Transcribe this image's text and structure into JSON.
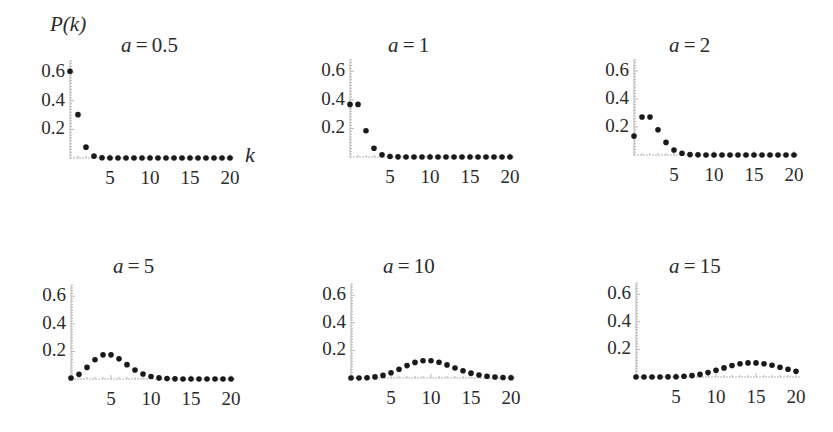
{
  "figure": {
    "y_axis_label": "P(k)",
    "x_axis_label": "k",
    "formula_hint": "Poisson: P(k) = a^k e^-a / k!"
  },
  "chart_data": [
    {
      "type": "scatter",
      "title": "a = 0.5",
      "param_a": 0.5,
      "xlabel": "k",
      "ylabel": "P(k)",
      "x_ticks": [
        5,
        10,
        15,
        20
      ],
      "y_ticks": [
        0.2,
        0.4,
        0.6
      ],
      "xlim": [
        0,
        20
      ],
      "ylim": [
        0,
        0.68
      ],
      "x": [
        0,
        1,
        2,
        3,
        4,
        5,
        6,
        7,
        8,
        9,
        10,
        11,
        12,
        13,
        14,
        15,
        16,
        17,
        18,
        19,
        20
      ],
      "values": [
        0.607,
        0.303,
        0.076,
        0.013,
        0.002,
        0.0,
        0.0,
        0.0,
        0.0,
        0.0,
        0.0,
        0.0,
        0.0,
        0.0,
        0.0,
        0.0,
        0.0,
        0.0,
        0.0,
        0.0,
        0.0
      ]
    },
    {
      "type": "scatter",
      "title": "a = 1",
      "param_a": 1,
      "xlabel": "k",
      "ylabel": "P(k)",
      "x_ticks": [
        5,
        10,
        15,
        20
      ],
      "y_ticks": [
        0.2,
        0.4,
        0.6
      ],
      "xlim": [
        0,
        20
      ],
      "ylim": [
        0,
        0.68
      ],
      "x": [
        0,
        1,
        2,
        3,
        4,
        5,
        6,
        7,
        8,
        9,
        10,
        11,
        12,
        13,
        14,
        15,
        16,
        17,
        18,
        19,
        20
      ],
      "values": [
        0.368,
        0.368,
        0.184,
        0.061,
        0.015,
        0.003,
        0.001,
        0.0,
        0.0,
        0.0,
        0.0,
        0.0,
        0.0,
        0.0,
        0.0,
        0.0,
        0.0,
        0.0,
        0.0,
        0.0,
        0.0
      ]
    },
    {
      "type": "scatter",
      "title": "a = 2",
      "param_a": 2,
      "xlabel": "k",
      "ylabel": "P(k)",
      "x_ticks": [
        5,
        10,
        15,
        20
      ],
      "y_ticks": [
        0.2,
        0.4,
        0.6
      ],
      "xlim": [
        0,
        20
      ],
      "ylim": [
        0,
        0.68
      ],
      "x": [
        0,
        1,
        2,
        3,
        4,
        5,
        6,
        7,
        8,
        9,
        10,
        11,
        12,
        13,
        14,
        15,
        16,
        17,
        18,
        19,
        20
      ],
      "values": [
        0.135,
        0.271,
        0.271,
        0.18,
        0.09,
        0.036,
        0.012,
        0.003,
        0.001,
        0.0,
        0.0,
        0.0,
        0.0,
        0.0,
        0.0,
        0.0,
        0.0,
        0.0,
        0.0,
        0.0,
        0.0
      ]
    },
    {
      "type": "scatter",
      "title": "a = 5",
      "param_a": 5,
      "xlabel": "k",
      "ylabel": "P(k)",
      "x_ticks": [
        5,
        10,
        15,
        20
      ],
      "y_ticks": [
        0.2,
        0.4,
        0.6
      ],
      "xlim": [
        0,
        20
      ],
      "ylim": [
        0,
        0.68
      ],
      "x": [
        0,
        1,
        2,
        3,
        4,
        5,
        6,
        7,
        8,
        9,
        10,
        11,
        12,
        13,
        14,
        15,
        16,
        17,
        18,
        19,
        20
      ],
      "values": [
        0.007,
        0.034,
        0.084,
        0.14,
        0.175,
        0.175,
        0.146,
        0.104,
        0.065,
        0.036,
        0.018,
        0.008,
        0.003,
        0.001,
        0.0,
        0.0,
        0.0,
        0.0,
        0.0,
        0.0,
        0.0
      ]
    },
    {
      "type": "scatter",
      "title": "a = 10",
      "param_a": 10,
      "xlabel": "k",
      "ylabel": "P(k)",
      "x_ticks": [
        5,
        10,
        15,
        20
      ],
      "y_ticks": [
        0.2,
        0.4,
        0.6
      ],
      "xlim": [
        0,
        20
      ],
      "ylim": [
        0,
        0.68
      ],
      "x": [
        0,
        1,
        2,
        3,
        4,
        5,
        6,
        7,
        8,
        9,
        10,
        11,
        12,
        13,
        14,
        15,
        16,
        17,
        18,
        19,
        20
      ],
      "values": [
        0.0,
        0.0,
        0.002,
        0.008,
        0.019,
        0.038,
        0.063,
        0.09,
        0.113,
        0.125,
        0.125,
        0.114,
        0.095,
        0.073,
        0.052,
        0.035,
        0.022,
        0.013,
        0.007,
        0.004,
        0.002
      ]
    },
    {
      "type": "scatter",
      "title": "a = 15",
      "param_a": 15,
      "xlabel": "k",
      "ylabel": "P(k)",
      "x_ticks": [
        5,
        10,
        15,
        20
      ],
      "y_ticks": [
        0.2,
        0.4,
        0.6
      ],
      "xlim": [
        0,
        20
      ],
      "ylim": [
        0,
        0.68
      ],
      "x": [
        0,
        1,
        2,
        3,
        4,
        5,
        6,
        7,
        8,
        9,
        10,
        11,
        12,
        13,
        14,
        15,
        16,
        17,
        18,
        19,
        20
      ],
      "values": [
        0.0,
        0.0,
        0.0,
        0.0,
        0.001,
        0.002,
        0.005,
        0.01,
        0.019,
        0.032,
        0.049,
        0.066,
        0.083,
        0.096,
        0.102,
        0.102,
        0.096,
        0.085,
        0.071,
        0.056,
        0.042
      ]
    }
  ],
  "panels_layout": [
    {
      "origin_x": 70,
      "origin_y": 158,
      "px_per_k": 8.0,
      "px_per_unit_y": 143,
      "title_x": 151,
      "title_y": 33
    },
    {
      "origin_x": 350,
      "origin_y": 157,
      "px_per_k": 8.0,
      "px_per_unit_y": 143,
      "title_x": 418,
      "title_y": 33
    },
    {
      "origin_x": 634,
      "origin_y": 155,
      "px_per_k": 8.0,
      "px_per_unit_y": 140,
      "title_x": 699,
      "title_y": 33
    },
    {
      "origin_x": 71,
      "origin_y": 379,
      "px_per_k": 8.0,
      "px_per_unit_y": 138,
      "title_x": 143,
      "title_y": 254
    },
    {
      "origin_x": 351,
      "origin_y": 378,
      "px_per_k": 8.0,
      "px_per_unit_y": 138,
      "title_x": 413,
      "title_y": 254
    },
    {
      "origin_x": 636,
      "origin_y": 377,
      "px_per_k": 8.0,
      "px_per_unit_y": 138,
      "title_x": 699,
      "title_y": 254
    }
  ],
  "style": {
    "point_color": "#1a1a1a",
    "axis_color": "#b5b5b5",
    "point_radius": 2.8
  }
}
